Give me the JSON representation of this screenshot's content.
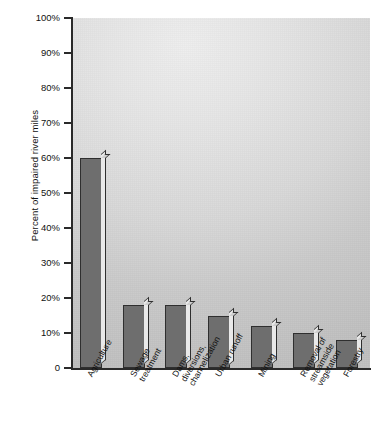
{
  "chart_data": {
    "type": "bar",
    "title": "",
    "subtitle": "",
    "xlabel": "",
    "ylabel": "Percent of impaired river miles",
    "ylim": [
      0,
      100
    ],
    "y_tick_labels": [
      "100%",
      "90%",
      "80%",
      "70%",
      "60%",
      "50%",
      "40%",
      "30%",
      "20%",
      "10%",
      "0"
    ],
    "y_tick_values": [
      100,
      90,
      80,
      70,
      60,
      50,
      40,
      30,
      20,
      10,
      0
    ],
    "grid": false,
    "legend": null,
    "categories": [
      "Agriculture",
      "Sewage\ntreatment",
      "Dams,\ndiversions,\nchannelization",
      "Urban runoff",
      "Mining",
      "Removal of\nstreamside\nvegetation",
      "Forestry"
    ],
    "values": [
      60,
      18,
      18,
      15,
      12,
      10,
      8
    ],
    "value_unit": "%",
    "colors": {
      "bar_face": "#6e6e6e",
      "bar_edge": "#2f2f2f",
      "bar_side": "#e9e9e9",
      "plot_background_light": "#eeeeee",
      "plot_background_dark": "#c0c0c0",
      "axis": "#2a2a2a",
      "text": "#111111"
    }
  }
}
